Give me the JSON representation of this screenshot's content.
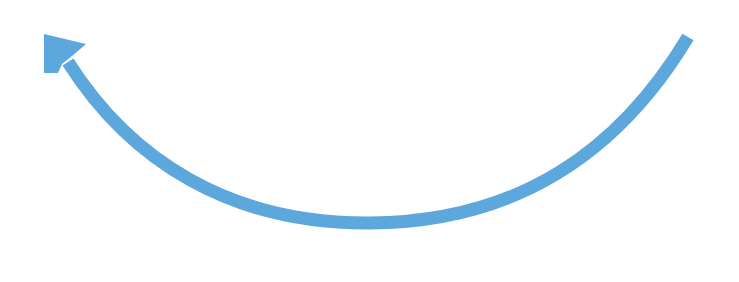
{
  "diagram": {
    "type": "curved-arrow",
    "direction": "counterclockwise",
    "stroke_color": "#5ca7dc",
    "background": "#ffffff",
    "stroke_width": 13,
    "start": [
      688,
      37
    ],
    "end_tip": [
      46,
      34
    ],
    "bottom_point": [
      370,
      223
    ]
  }
}
